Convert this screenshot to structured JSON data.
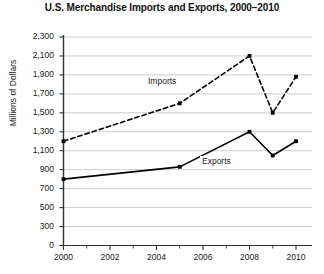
{
  "chart_data": {
    "type": "line",
    "title": "U.S. Merchandise Imports and Exports, 2000–2010",
    "xlabel": "",
    "ylabel": "Millions of Dollars",
    "x": [
      2000,
      2005,
      2008,
      2009,
      2010
    ],
    "series": [
      {
        "name": "Imports",
        "style": "dashed",
        "values": [
          1200,
          1600,
          2100,
          1500,
          1880
        ]
      },
      {
        "name": "Exports",
        "style": "solid",
        "values": [
          800,
          930,
          1300,
          1050,
          1200
        ]
      }
    ],
    "xlim": [
      2000,
      2010
    ],
    "x_ticks": [
      2000,
      2002,
      2004,
      2006,
      2008,
      2010
    ],
    "x_minor_ticks": [
      2001,
      2003,
      2005,
      2007,
      2009
    ],
    "y_ticks": [
      0,
      300,
      500,
      700,
      900,
      1100,
      1300,
      1500,
      1700,
      1900,
      2100,
      2300
    ],
    "y_tick_labels": [
      "0",
      "300",
      "500",
      "700",
      "900",
      "1,100",
      "1,300",
      "1,500",
      "1,700",
      "1,900",
      "2,100",
      "2,300"
    ],
    "ylim": [
      0,
      2300
    ],
    "axis_break": true,
    "grid": "horizontal",
    "legend": "inline-labels",
    "annotations": [
      {
        "text": "Imports",
        "x": 2003.6,
        "y": 1790
      },
      {
        "text": "Exports",
        "x": 2006.1,
        "y": 1030
      }
    ],
    "colors": {
      "line": "#000000",
      "grid": "#c8c8c8",
      "axis": "#333333",
      "background": "#ffffff",
      "text": "#1a1a1a"
    }
  }
}
